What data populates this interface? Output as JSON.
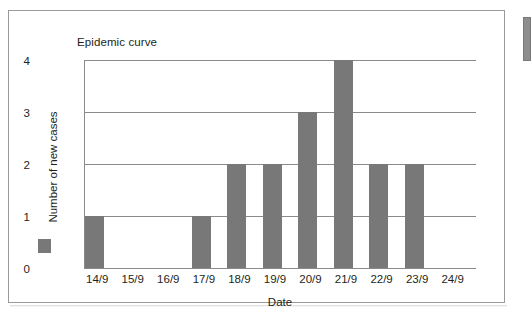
{
  "figure": {
    "title": "Epidemic curve",
    "frame_color": "#9a9a9a",
    "background": "#ffffff"
  },
  "legend": {
    "swatch_color": "#787878",
    "swatch_name": "series-swatch"
  },
  "chart_data": {
    "type": "bar",
    "title": "Epidemic curve",
    "categories": [
      "14/9",
      "15/9",
      "16/9",
      "17/9",
      "18/9",
      "19/9",
      "20/9",
      "21/9",
      "22/9",
      "23/9",
      "24/9"
    ],
    "values": [
      1,
      0,
      0,
      1,
      2,
      2,
      3,
      4,
      2,
      2,
      0
    ],
    "series": [
      {
        "name": "Number of new cases",
        "values": [
          1,
          0,
          0,
          1,
          2,
          2,
          3,
          4,
          2,
          2,
          0
        ],
        "color": "#787878"
      }
    ],
    "xlabel": "Date",
    "ylabel": "Number of new cases",
    "ylim": [
      0,
      4
    ],
    "yticks": [
      0,
      1,
      2,
      3,
      4
    ],
    "ytick_labels": [
      "0",
      "1",
      "2",
      "3",
      "4"
    ],
    "grid": true,
    "grid_axis": "y",
    "grid_color": "#8a8a8a",
    "legend_position": "left",
    "bar_color": "#787878"
  }
}
